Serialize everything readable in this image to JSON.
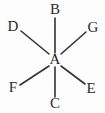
{
  "figure": {
    "type": "chemical-structure",
    "background_color": "#fdfdfd",
    "bond_color": "#333333",
    "label_color": "#2b2b2b",
    "width": 105,
    "height": 113
  },
  "center_atom": {
    "label": "A",
    "x": 55,
    "y": 60
  },
  "substituents": [
    {
      "id": "B",
      "label": "B",
      "position": "top",
      "label_x": 55,
      "label_y": 10,
      "bond_x1": 55,
      "bond_y1": 18,
      "bond_x2": 55,
      "bond_y2": 53
    },
    {
      "id": "G",
      "label": "G",
      "position": "upper-right",
      "label_x": 93,
      "label_y": 28,
      "bond_x1": 86,
      "bond_y1": 32,
      "bond_x2": 61,
      "bond_y2": 54
    },
    {
      "id": "E",
      "label": "E",
      "position": "lower-right",
      "label_x": 91,
      "label_y": 89,
      "bond_x1": 85,
      "bond_y1": 84,
      "bond_x2": 61,
      "bond_y2": 66
    },
    {
      "id": "C",
      "label": "C",
      "position": "bottom",
      "label_x": 55,
      "label_y": 104,
      "bond_x1": 55,
      "bond_y1": 97,
      "bond_x2": 55,
      "bond_y2": 67
    },
    {
      "id": "F",
      "label": "F",
      "position": "lower-left",
      "label_x": 13,
      "label_y": 88,
      "bond_x1": 20,
      "bond_y1": 85,
      "bond_x2": 49,
      "bond_y2": 66
    },
    {
      "id": "D",
      "label": "D",
      "position": "upper-left",
      "label_x": 13,
      "label_y": 27,
      "bond_x1": 21,
      "bond_y1": 31,
      "bond_x2": 49,
      "bond_y2": 54
    }
  ],
  "chart_data": {
    "type": "diagram",
    "nodes": [
      "A",
      "B",
      "C",
      "D",
      "E",
      "F",
      "G"
    ],
    "center": "A",
    "edges": [
      {
        "from": "A",
        "to": "B",
        "direction": "up"
      },
      {
        "from": "A",
        "to": "G",
        "direction": "upper-right"
      },
      {
        "from": "A",
        "to": "E",
        "direction": "lower-right"
      },
      {
        "from": "A",
        "to": "C",
        "direction": "down"
      },
      {
        "from": "A",
        "to": "F",
        "direction": "lower-left"
      },
      {
        "from": "A",
        "to": "D",
        "direction": "upper-left"
      }
    ],
    "edge_count": 6,
    "legend": [],
    "annotations": []
  }
}
